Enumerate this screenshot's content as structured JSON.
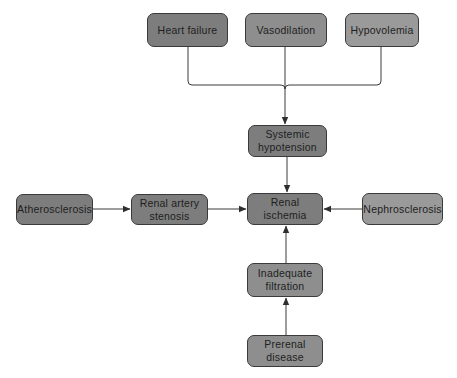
{
  "diagram": {
    "type": "flowchart",
    "nodes": {
      "heart_failure": {
        "label": "Heart failure"
      },
      "vasodilation": {
        "label": "Vasodilation"
      },
      "hypovolemia": {
        "label": "Hypovolemia"
      },
      "systemic_hypotension": {
        "line1": "Systemic",
        "line2": "hypotension"
      },
      "atherosclerosis": {
        "label": "Atherosclerosis"
      },
      "renal_artery_stenosis": {
        "line1": "Renal artery",
        "line2": "stenosis"
      },
      "renal_ischemia": {
        "line1": "Renal",
        "line2": "ischemia"
      },
      "nephrosclerosis": {
        "label": "Nephrosclerosis"
      },
      "inadequate_filtration": {
        "line1": "Inadequate",
        "line2": "filtration"
      },
      "prerenal_disease": {
        "line1": "Prerenal",
        "line2": "disease"
      }
    },
    "edges": [
      {
        "from": "Heart failure",
        "to": "Systemic hypotension"
      },
      {
        "from": "Vasodilation",
        "to": "Systemic hypotension"
      },
      {
        "from": "Hypovolemia",
        "to": "Systemic hypotension"
      },
      {
        "from": "Systemic hypotension",
        "to": "Renal ischemia"
      },
      {
        "from": "Atherosclerosis",
        "to": "Renal artery stenosis"
      },
      {
        "from": "Renal artery stenosis",
        "to": "Renal ischemia"
      },
      {
        "from": "Nephrosclerosis",
        "to": "Renal ischemia"
      },
      {
        "from": "Inadequate filtration",
        "to": "Renal ischemia"
      },
      {
        "from": "Prerenal disease",
        "to": "Inadequate filtration"
      }
    ],
    "colors": {
      "node_dark": "#7d7d7d",
      "node_mid": "#8e8e8e",
      "node_light": "#9a9a9a",
      "border": "#3a3a3a",
      "line": "#3a3a3a",
      "background": "#ffffff"
    }
  }
}
